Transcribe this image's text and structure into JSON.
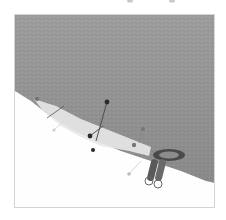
{
  "image": {
    "subject": "grey felt fabric with light interfacing strip, pins and zipper pull",
    "colors": {
      "background": "#ffffff",
      "frame_border": "#d4d4d4",
      "fabric": "#9c9c9c",
      "fabric_shadow": "#8a8a8a",
      "interfacing": "#e6e6e6",
      "pin_head_dark": "#2a2a2a",
      "pin_head_grey": "#707070",
      "pin_head_light": "#bdbdbd",
      "zipper": "#4a4a4a"
    }
  }
}
